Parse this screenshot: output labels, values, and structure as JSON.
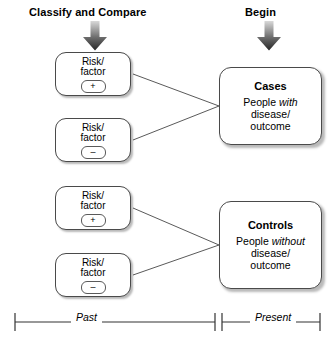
{
  "diagram": {
    "type": "case-control-study-design",
    "headers": {
      "left": "Classify and Compare",
      "right": "Begin"
    },
    "arrows": [
      {
        "name": "classify-and-compare-arrow",
        "direction": "down"
      },
      {
        "name": "begin-arrow",
        "direction": "down"
      }
    ],
    "risk_boxes": [
      {
        "label_line1": "Risk/",
        "label_line2": "factor",
        "sign": "+",
        "group": "cases"
      },
      {
        "label_line1": "Risk/",
        "label_line2": "factor",
        "sign": "–",
        "group": "cases"
      },
      {
        "label_line1": "Risk/",
        "label_line2": "factor",
        "sign": "+",
        "group": "controls"
      },
      {
        "label_line1": "Risk/",
        "label_line2": "factor",
        "sign": "–",
        "group": "controls"
      }
    ],
    "outcome_boxes": [
      {
        "title": "Cases",
        "body_pre": "People ",
        "body_em": "with",
        "body_post": " disease/ outcome",
        "line1_pre": "People ",
        "line1_em": "with",
        "line2": "disease/",
        "line3": "outcome"
      },
      {
        "title": "Controls",
        "body_pre": "People ",
        "body_em": "without",
        "body_post": " disease/ outcome",
        "line1_pre": "People ",
        "line1_em": "without",
        "line2": "disease/",
        "line3": "outcome"
      }
    ],
    "timeline": {
      "segments": [
        {
          "label": "Past"
        },
        {
          "label": "Present"
        }
      ]
    },
    "colors": {
      "stroke": "#4a4a4a",
      "text": "#000000",
      "background": "#ffffff",
      "arrow_dark": "#2b2b2b",
      "arrow_light": "#d9d9d9"
    }
  }
}
